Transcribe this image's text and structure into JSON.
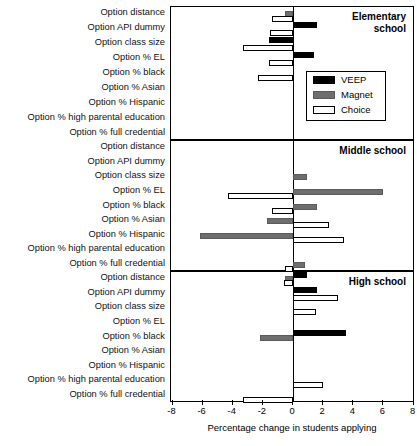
{
  "chart_data": {
    "type": "bar",
    "orientation": "horizontal",
    "title": "",
    "xlabel": "Percentage change in students applying",
    "ylabel": "",
    "xlim": [
      -8,
      8
    ],
    "xticks": [
      -8,
      -6,
      -4,
      -2,
      0,
      2,
      4,
      6,
      8
    ],
    "xticklabels": [
      "-8",
      "-6",
      "-4",
      "-2",
      "0",
      "2",
      "4",
      "6",
      "8"
    ],
    "grid": false,
    "legend": {
      "position": "inside-upper-right-panel-1",
      "entries": [
        {
          "name": "VEEP",
          "color": "#000000",
          "style": "filled-black"
        },
        {
          "name": "Magnet",
          "color": "#6e6e6e",
          "style": "filled-gray"
        },
        {
          "name": "Choice",
          "color": "#ffffff",
          "style": "open-white"
        }
      ]
    },
    "categories": [
      "Option distance",
      "Option API dummy",
      "Option class size",
      "Option % EL",
      "Option % black",
      "Option % Asian",
      "Option % Hispanic",
      "Option % high parental education",
      "Option % full credential"
    ],
    "panels": [
      {
        "title": "Elementary school",
        "title_lines": [
          "Elementary",
          "school"
        ],
        "series": [
          {
            "name": "VEEP",
            "values": [
              0,
              1.6,
              -1.6,
              1.4,
              0,
              0,
              0,
              0,
              0
            ]
          },
          {
            "name": "Magnet",
            "values": [
              -0.5,
              0,
              0,
              0,
              0,
              0,
              0,
              0,
              0
            ]
          },
          {
            "name": "Choice",
            "values": [
              -1.4,
              -1.5,
              -3.3,
              -1.6,
              -2.3,
              0,
              0,
              0,
              0
            ]
          }
        ]
      },
      {
        "title": "Middle school",
        "title_lines": [
          "Middle school"
        ],
        "series": [
          {
            "name": "VEEP",
            "values": [
              0,
              0,
              0,
              0,
              0,
              0,
              0,
              0,
              0
            ]
          },
          {
            "name": "Magnet",
            "values": [
              0,
              0,
              0.9,
              6.0,
              1.6,
              -1.7,
              -6.2,
              0,
              0.8
            ]
          },
          {
            "name": "Choice",
            "values": [
              0,
              0,
              0,
              -4.3,
              -1.4,
              2.4,
              3.4,
              0,
              -0.5
            ]
          }
        ]
      },
      {
        "title": "High school",
        "title_lines": [
          "High school"
        ],
        "series": [
          {
            "name": "VEEP",
            "values": [
              0.9,
              1.6,
              0,
              0,
              3.5,
              0,
              0,
              0,
              0
            ]
          },
          {
            "name": "Magnet",
            "values": [
              -0.5,
              0,
              0,
              0,
              -2.2,
              0,
              0,
              0,
              0
            ]
          },
          {
            "name": "Choice",
            "values": [
              -0.6,
              3.0,
              1.5,
              0,
              0,
              0,
              0,
              2.0,
              -3.3
            ]
          }
        ]
      }
    ]
  }
}
